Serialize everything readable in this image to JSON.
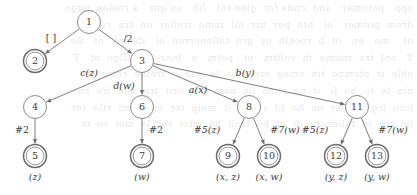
{
  "figure": {
    "kind": "directed-tree-diagram",
    "title": "",
    "nodes": [
      {
        "id": "1",
        "label": "1",
        "x": 89,
        "y": 22,
        "r": 11.5,
        "double": false,
        "caption": ""
      },
      {
        "id": "2",
        "label": "2",
        "x": 35,
        "y": 61,
        "r": 11.5,
        "double": true,
        "caption": ""
      },
      {
        "id": "3",
        "label": "3",
        "x": 142,
        "y": 61,
        "r": 11.5,
        "double": false,
        "caption": ""
      },
      {
        "id": "4",
        "label": "4",
        "x": 35,
        "y": 107,
        "r": 11.5,
        "double": false,
        "caption": ""
      },
      {
        "id": "6",
        "label": "6",
        "x": 142,
        "y": 107,
        "r": 11.5,
        "double": false,
        "caption": ""
      },
      {
        "id": "8",
        "label": "8",
        "x": 249,
        "y": 107,
        "r": 11.5,
        "double": false,
        "caption": ""
      },
      {
        "id": "11",
        "label": "11",
        "x": 357,
        "y": 107,
        "r": 11.5,
        "double": false,
        "caption": ""
      },
      {
        "id": "5",
        "label": "5",
        "x": 35,
        "y": 156,
        "r": 11.5,
        "double": true,
        "caption": "(z)"
      },
      {
        "id": "7",
        "label": "7",
        "x": 142,
        "y": 156,
        "r": 11.5,
        "double": true,
        "caption": "(w)"
      },
      {
        "id": "9",
        "label": "9",
        "x": 228,
        "y": 156,
        "r": 11.5,
        "double": true,
        "caption": "(x, z)"
      },
      {
        "id": "10",
        "label": "10",
        "x": 269,
        "y": 156,
        "r": 11.5,
        "double": true,
        "caption": "(x, w)"
      },
      {
        "id": "12",
        "label": "12",
        "x": 336,
        "y": 156,
        "r": 11.5,
        "double": true,
        "caption": "(y, z)"
      },
      {
        "id": "13",
        "label": "13",
        "x": 377,
        "y": 156,
        "r": 11.5,
        "double": true,
        "caption": "(y, w)"
      }
    ],
    "edges": [
      {
        "from": "1",
        "to": "2",
        "label": "[ ]",
        "italic": false,
        "lx": 51,
        "ly": 41
      },
      {
        "from": "1",
        "to": "3",
        "label": "/2",
        "italic": false,
        "lx": 128,
        "ly": 42
      },
      {
        "from": "3",
        "to": "4",
        "label": "c(z)",
        "italic": true,
        "lx": 89,
        "ly": 76
      },
      {
        "from": "3",
        "to": "6",
        "label": "d(w)",
        "italic": true,
        "lx": 124,
        "ly": 89
      },
      {
        "from": "3",
        "to": "8",
        "label": "a(x)",
        "italic": true,
        "lx": 198,
        "ly": 93
      },
      {
        "from": "3",
        "to": "11",
        "label": "b(y)",
        "italic": true,
        "lx": 245,
        "ly": 76
      },
      {
        "from": "4",
        "to": "5",
        "label": "#2",
        "italic": false,
        "lx": 22,
        "ly": 133
      },
      {
        "from": "6",
        "to": "7",
        "label": "#2",
        "italic": false,
        "lx": 156,
        "ly": 133
      },
      {
        "from": "8",
        "to": "9",
        "label": "#5(z)",
        "italic": true,
        "lx": 207,
        "ly": 133
      },
      {
        "from": "8",
        "to": "10",
        "label": "#7(w)",
        "italic": true,
        "lx": 285,
        "ly": 133
      },
      {
        "from": "11",
        "to": "12",
        "label": "#5(z)",
        "italic": true,
        "lx": 315,
        "ly": 133
      },
      {
        "from": "11",
        "to": "13",
        "label": "#7(w)",
        "italic": true,
        "lx": 393,
        "ly": 133
      }
    ],
    "colors": {
      "edge": "#6e6e6e",
      "node_stroke": "#8a8a8a",
      "double_node_stroke": "#6b6b6b",
      "text": "#3b3b3b",
      "background": "#ffffff"
    }
  },
  "background_bleed": {
    "lines": [
      "opp   potomer   and  cnde for  glbo rot   lih   au gnr   a rooloe  nggo",
      "drom  potmer   ol   hto  per  ntr  oil  tamo  troller  on  tra  cinrrm",
      "ot    mo   en   ot  b  rooelh  oy  gro  tallenorren  ol   ibenol   ot   ilo",
      "T   onl  tre  roilme  ih  volltm   ot   potm   e   lnor   ol   tllgo  ot   T",
      "ohle  ir  otemno  tin  vmeg  ore  ttoa  le  gao  o  troille  rotor  tni",
      "nln  le  ti   ho  li   it  no  rtmo  lie  nem  gre  orit  tre  mot  lro  ro",
      "loro  lrg   toiller  on  ho  lit  rnooe  it  moig  ter  onllo  mi  rtlo  ter",
      "lio  tre  in  tolomore  ih  ot  bo  troll  ho  mtoi  rer  lo  moi  ro  tr"
    ]
  }
}
